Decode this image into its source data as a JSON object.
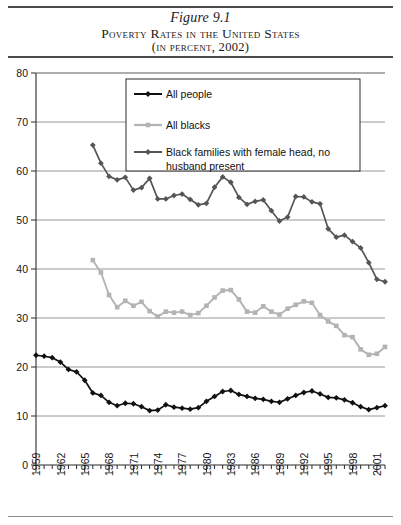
{
  "header": {
    "figure_number": "Figure 9.1",
    "title": "Poverty Rates in the United States",
    "subtitle": "(in percent, 2002)"
  },
  "chart_data": {
    "type": "line",
    "title": "Poverty Rates in the United States",
    "subtitle": "(in percent, 2002)",
    "xlabel": "",
    "ylabel": "",
    "xlim": [
      1959,
      2002
    ],
    "ylim": [
      0,
      80
    ],
    "yticks": [
      0,
      10,
      20,
      30,
      40,
      50,
      60,
      70,
      80
    ],
    "xticks": [
      1959,
      1962,
      1965,
      1968,
      1971,
      1974,
      1977,
      1980,
      1983,
      1986,
      1989,
      1992,
      1995,
      1998,
      2001
    ],
    "xtick_labels": [
      "1959",
      "1962",
      "1965",
      "1968",
      "1971",
      "1974",
      "1977",
      "1980",
      "1983",
      "1986",
      "1989",
      "1992",
      "1995",
      "1998",
      "2001"
    ],
    "grid": "horizontal",
    "legend_position": "upper-center",
    "series": [
      {
        "name": "All people",
        "color": "#111111",
        "marker": "diamond",
        "x": [
          1959,
          1960,
          1961,
          1962,
          1963,
          1964,
          1965,
          1966,
          1967,
          1968,
          1969,
          1970,
          1971,
          1972,
          1973,
          1974,
          1975,
          1976,
          1977,
          1978,
          1979,
          1980,
          1981,
          1982,
          1983,
          1984,
          1985,
          1986,
          1987,
          1988,
          1989,
          1990,
          1991,
          1992,
          1993,
          1994,
          1995,
          1996,
          1997,
          1998,
          1999,
          2000,
          2001,
          2002
        ],
        "values": [
          22.4,
          22.2,
          21.9,
          21.0,
          19.5,
          19.0,
          17.3,
          14.7,
          14.2,
          12.8,
          12.1,
          12.6,
          12.5,
          11.9,
          11.1,
          11.2,
          12.3,
          11.8,
          11.6,
          11.4,
          11.7,
          13.0,
          14.0,
          15.0,
          15.2,
          14.4,
          14.0,
          13.6,
          13.4,
          13.0,
          12.8,
          13.5,
          14.2,
          14.8,
          15.1,
          14.5,
          13.8,
          13.7,
          13.3,
          12.7,
          11.9,
          11.3,
          11.7,
          12.1
        ]
      },
      {
        "name": "All blacks",
        "color": "#b3b3b3",
        "marker": "square",
        "x": [
          1966,
          1967,
          1968,
          1969,
          1970,
          1971,
          1972,
          1973,
          1974,
          1975,
          1976,
          1977,
          1978,
          1979,
          1980,
          1981,
          1982,
          1983,
          1984,
          1985,
          1986,
          1987,
          1988,
          1989,
          1990,
          1991,
          1992,
          1993,
          1994,
          1995,
          1996,
          1997,
          1998,
          1999,
          2000,
          2001,
          2002
        ],
        "values": [
          41.8,
          39.3,
          34.7,
          32.2,
          33.5,
          32.5,
          33.3,
          31.4,
          30.3,
          31.3,
          31.1,
          31.3,
          30.6,
          31.0,
          32.5,
          34.2,
          35.6,
          35.7,
          33.8,
          31.3,
          31.1,
          32.4,
          31.3,
          30.7,
          31.9,
          32.7,
          33.4,
          33.1,
          30.6,
          29.3,
          28.4,
          26.5,
          26.1,
          23.6,
          22.5,
          22.7,
          24.1
        ]
      },
      {
        "name": "Black families with female head, no husband present",
        "color": "#555555",
        "marker": "diamond",
        "x": [
          1966,
          1967,
          1968,
          1969,
          1970,
          1971,
          1972,
          1973,
          1974,
          1975,
          1976,
          1977,
          1978,
          1979,
          1980,
          1981,
          1982,
          1983,
          1984,
          1985,
          1986,
          1987,
          1988,
          1989,
          1990,
          1991,
          1992,
          1993,
          1994,
          1995,
          1996,
          1997,
          1998,
          1999,
          2000,
          2001,
          2002
        ],
        "values": [
          65.3,
          61.6,
          58.9,
          58.2,
          58.7,
          56.1,
          56.6,
          58.5,
          54.3,
          54.3,
          55.0,
          55.3,
          54.2,
          53.1,
          53.4,
          56.7,
          58.8,
          57.7,
          54.6,
          53.2,
          53.8,
          54.1,
          51.9,
          49.8,
          50.6,
          54.8,
          54.7,
          53.7,
          53.3,
          48.2,
          46.5,
          46.9,
          45.6,
          44.3,
          41.3,
          37.9,
          37.4
        ]
      }
    ]
  }
}
